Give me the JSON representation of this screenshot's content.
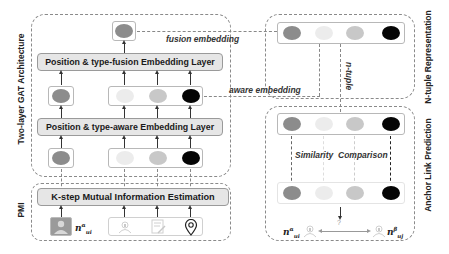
{
  "groups": {
    "gat": {
      "label": "Two-layer GAT Architecture"
    },
    "pmi": {
      "label": "PMI"
    },
    "ntuple": {
      "label": "N-tuple Representation"
    },
    "anchor": {
      "label": "Anchor Link Prediction"
    }
  },
  "layers": {
    "fusion": "Position & type-fusion Embedding Layer",
    "aware": "Position & type-aware Embedding Layer",
    "kstep": "K-step Mutual Information Estimation"
  },
  "edge_labels": {
    "fusion_embedding": "fusion embedding",
    "aware_embedding": "aware embedding",
    "n_tuple": "n-tuple",
    "similarity": "Similarity",
    "comparison": "Comparison",
    "question": "?"
  },
  "math": {
    "pmi_user": {
      "base": "n",
      "sup": "α",
      "sub": "u",
      "subsub": "i"
    },
    "anchor_left": {
      "base": "n",
      "sup": "α",
      "sub": "u",
      "subsub": "i"
    },
    "anchor_right": {
      "base": "n",
      "sup": "β",
      "sub": "u",
      "subsub": "j"
    }
  },
  "icons": {
    "user_photo": "user-photo-icon",
    "user_profile": "user-profile-icon",
    "text_post": "text-post-icon",
    "location": "location-pin-icon",
    "user_left": "user-icon",
    "user_right": "user-icon"
  },
  "colors": {
    "node_mid": "#8c8c8c",
    "node_light": "#ececec",
    "node_lightgray": "#c8c8c8",
    "node_black": "#050505",
    "layer_fill": "#e6e6e6"
  }
}
